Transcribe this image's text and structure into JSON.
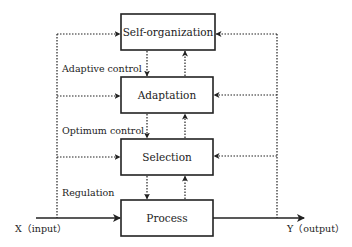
{
  "diagram": {
    "colors": {
      "stroke": "#222222",
      "background": "#ffffff"
    },
    "boxes": [
      {
        "id": "self-organization",
        "label": "Self-organization",
        "x": 121,
        "y": 14,
        "w": 94,
        "h": 36
      },
      {
        "id": "adaptation",
        "label": "Adaptation",
        "x": 121,
        "y": 77,
        "w": 92,
        "h": 36
      },
      {
        "id": "selection",
        "label": "Selection",
        "x": 121,
        "y": 139,
        "w": 92,
        "h": 36
      },
      {
        "id": "process",
        "label": "Process",
        "x": 121,
        "y": 200,
        "w": 92,
        "h": 36
      }
    ],
    "side_labels": [
      {
        "id": "adaptive-control",
        "label": "Adaptive control"
      },
      {
        "id": "optimum-control",
        "label": "Optimum control"
      },
      {
        "id": "regulation",
        "label": "Regulation"
      }
    ],
    "input": {
      "label": "X（input）"
    },
    "output": {
      "label": "Y（output）"
    }
  }
}
